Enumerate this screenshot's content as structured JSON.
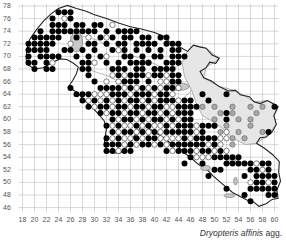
{
  "map": {
    "caption_species": "Dryopteris affinis",
    "caption_suffix": " agg.",
    "y_axis_ticks": [
      78,
      76,
      74,
      72,
      70,
      68,
      66,
      64,
      62,
      60,
      58,
      56,
      54,
      52,
      50,
      48,
      46
    ],
    "x_axis_ticks": [
      18,
      20,
      22,
      24,
      26,
      28,
      30,
      32,
      34,
      36,
      38,
      40,
      42,
      44,
      46,
      48,
      50,
      52,
      54,
      56,
      58,
      60
    ],
    "colors": {
      "grid": "#bdbdbd",
      "outline": "#222222",
      "inner_border": "#888888",
      "shaded_region": "#e6e6e6",
      "record_recent": "#000000",
      "record_old": "#ffffff",
      "record_gray": "#a8a8a8"
    },
    "legend_semantics": {
      "filled_black": "recent record",
      "open_white": "older record",
      "gray": "record in shaded zone"
    },
    "records_black": [
      [
        24,
        77
      ],
      [
        25,
        77
      ],
      [
        26,
        77
      ],
      [
        23,
        76
      ],
      [
        26,
        76
      ],
      [
        23,
        75
      ],
      [
        24,
        75
      ],
      [
        25,
        75
      ],
      [
        27,
        75
      ],
      [
        28,
        75
      ],
      [
        30,
        75
      ],
      [
        31,
        75
      ],
      [
        21,
        74
      ],
      [
        23,
        74
      ],
      [
        24,
        74
      ],
      [
        25,
        74
      ],
      [
        26,
        74
      ],
      [
        27,
        74
      ],
      [
        28,
        74
      ],
      [
        29,
        74
      ],
      [
        30,
        74
      ],
      [
        32,
        74
      ],
      [
        34,
        74
      ],
      [
        35,
        74
      ],
      [
        36,
        74
      ],
      [
        37,
        74
      ],
      [
        20,
        73
      ],
      [
        21,
        73
      ],
      [
        22,
        73
      ],
      [
        23,
        73
      ],
      [
        24,
        73
      ],
      [
        27,
        73
      ],
      [
        31,
        73
      ],
      [
        33,
        73
      ],
      [
        35,
        73
      ],
      [
        36,
        73
      ],
      [
        38,
        73
      ],
      [
        39,
        73
      ],
      [
        41,
        73
      ],
      [
        42,
        73
      ],
      [
        19,
        72
      ],
      [
        20,
        72
      ],
      [
        21,
        72
      ],
      [
        22,
        72
      ],
      [
        23,
        72
      ],
      [
        29,
        72
      ],
      [
        30,
        72
      ],
      [
        32,
        72
      ],
      [
        34,
        72
      ],
      [
        35,
        72
      ],
      [
        37,
        72
      ],
      [
        38,
        72
      ],
      [
        39,
        72
      ],
      [
        40,
        72
      ],
      [
        42,
        72
      ],
      [
        43,
        72
      ],
      [
        44,
        72
      ],
      [
        19,
        71
      ],
      [
        20,
        71
      ],
      [
        21,
        71
      ],
      [
        22,
        71
      ],
      [
        25,
        71
      ],
      [
        26,
        71
      ],
      [
        28,
        71
      ],
      [
        30,
        71
      ],
      [
        33,
        71
      ],
      [
        35,
        71
      ],
      [
        37,
        71
      ],
      [
        39,
        71
      ],
      [
        41,
        71
      ],
      [
        43,
        71
      ],
      [
        44,
        71
      ],
      [
        19,
        70
      ],
      [
        21,
        70
      ],
      [
        22,
        70
      ],
      [
        23,
        70
      ],
      [
        24,
        70
      ],
      [
        27,
        70
      ],
      [
        29,
        70
      ],
      [
        31,
        70
      ],
      [
        35,
        70
      ],
      [
        36,
        70
      ],
      [
        38,
        70
      ],
      [
        40,
        70
      ],
      [
        41,
        70
      ],
      [
        43,
        70
      ],
      [
        44,
        70
      ],
      [
        45,
        70
      ],
      [
        19,
        69
      ],
      [
        20,
        69
      ],
      [
        22,
        69
      ],
      [
        28,
        69
      ],
      [
        29,
        69
      ],
      [
        32,
        69
      ],
      [
        34,
        69
      ],
      [
        36,
        69
      ],
      [
        37,
        69
      ],
      [
        38,
        69
      ],
      [
        39,
        69
      ],
      [
        42,
        69
      ],
      [
        43,
        69
      ],
      [
        44,
        69
      ],
      [
        20,
        68
      ],
      [
        22,
        68
      ],
      [
        23,
        68
      ],
      [
        28,
        68
      ],
      [
        29,
        68
      ],
      [
        33,
        68
      ],
      [
        34,
        68
      ],
      [
        35,
        68
      ],
      [
        37,
        68
      ],
      [
        38,
        68
      ],
      [
        40,
        68
      ],
      [
        41,
        68
      ],
      [
        42,
        68
      ],
      [
        43,
        68
      ],
      [
        29,
        67
      ],
      [
        34,
        67
      ],
      [
        36,
        67
      ],
      [
        37,
        67
      ],
      [
        38,
        67
      ],
      [
        40,
        67
      ],
      [
        41,
        67
      ],
      [
        43,
        67
      ],
      [
        44,
        67
      ],
      [
        30,
        66
      ],
      [
        35,
        66
      ],
      [
        36,
        66
      ],
      [
        37,
        66
      ],
      [
        39,
        66
      ],
      [
        43,
        66
      ],
      [
        44,
        66
      ],
      [
        26,
        65
      ],
      [
        31,
        65
      ],
      [
        32,
        65
      ],
      [
        33,
        65
      ],
      [
        34,
        65
      ],
      [
        36,
        65
      ],
      [
        38,
        65
      ],
      [
        40,
        65
      ],
      [
        42,
        65
      ],
      [
        43,
        65
      ],
      [
        27,
        64
      ],
      [
        28,
        64
      ],
      [
        29,
        64
      ],
      [
        33,
        64
      ],
      [
        34,
        64
      ],
      [
        35,
        64
      ],
      [
        37,
        64
      ],
      [
        38,
        64
      ],
      [
        39,
        64
      ],
      [
        41,
        64
      ],
      [
        42,
        64
      ],
      [
        48,
        64
      ],
      [
        52,
        64
      ],
      [
        28,
        63
      ],
      [
        30,
        63
      ],
      [
        32,
        63
      ],
      [
        34,
        63
      ],
      [
        36,
        63
      ],
      [
        37,
        63
      ],
      [
        39,
        63
      ],
      [
        41,
        63
      ],
      [
        42,
        63
      ],
      [
        43,
        63
      ],
      [
        45,
        63
      ],
      [
        46,
        63
      ],
      [
        49,
        63
      ],
      [
        29,
        62
      ],
      [
        31,
        62
      ],
      [
        32,
        62
      ],
      [
        34,
        62
      ],
      [
        35,
        62
      ],
      [
        37,
        62
      ],
      [
        38,
        62
      ],
      [
        40,
        62
      ],
      [
        41,
        62
      ],
      [
        44,
        62
      ],
      [
        45,
        62
      ],
      [
        46,
        62
      ],
      [
        47,
        62
      ],
      [
        60,
        62
      ],
      [
        31,
        61
      ],
      [
        33,
        61
      ],
      [
        34,
        61
      ],
      [
        36,
        61
      ],
      [
        37,
        61
      ],
      [
        39,
        61
      ],
      [
        40,
        61
      ],
      [
        42,
        61
      ],
      [
        44,
        61
      ],
      [
        45,
        61
      ],
      [
        46,
        61
      ],
      [
        52,
        61
      ],
      [
        33,
        60
      ],
      [
        35,
        60
      ],
      [
        36,
        60
      ],
      [
        38,
        60
      ],
      [
        40,
        60
      ],
      [
        41,
        60
      ],
      [
        43,
        60
      ],
      [
        45,
        60
      ],
      [
        46,
        60
      ],
      [
        52,
        60
      ],
      [
        32,
        59
      ],
      [
        34,
        59
      ],
      [
        37,
        59
      ],
      [
        39,
        59
      ],
      [
        42,
        59
      ],
      [
        44,
        59
      ],
      [
        45,
        59
      ],
      [
        46,
        59
      ],
      [
        48,
        59
      ],
      [
        49,
        59
      ],
      [
        50,
        59
      ],
      [
        33,
        58
      ],
      [
        35,
        58
      ],
      [
        36,
        58
      ],
      [
        38,
        58
      ],
      [
        40,
        58
      ],
      [
        42,
        58
      ],
      [
        43,
        58
      ],
      [
        44,
        58
      ],
      [
        45,
        58
      ],
      [
        46,
        58
      ],
      [
        48,
        58
      ],
      [
        59,
        58
      ],
      [
        32,
        57
      ],
      [
        34,
        57
      ],
      [
        37,
        57
      ],
      [
        39,
        57
      ],
      [
        40,
        57
      ],
      [
        45,
        57
      ],
      [
        47,
        57
      ],
      [
        48,
        57
      ],
      [
        49,
        57
      ],
      [
        50,
        57
      ],
      [
        32,
        56
      ],
      [
        33,
        56
      ],
      [
        34,
        56
      ],
      [
        36,
        56
      ],
      [
        38,
        56
      ],
      [
        39,
        56
      ],
      [
        41,
        56
      ],
      [
        43,
        56
      ],
      [
        44,
        56
      ],
      [
        45,
        56
      ],
      [
        46,
        56
      ],
      [
        47,
        56
      ],
      [
        48,
        56
      ],
      [
        50,
        56
      ],
      [
        32,
        55
      ],
      [
        33,
        55
      ],
      [
        35,
        55
      ],
      [
        36,
        55
      ],
      [
        42,
        55
      ],
      [
        44,
        55
      ],
      [
        45,
        55
      ],
      [
        46,
        55
      ],
      [
        48,
        55
      ],
      [
        49,
        55
      ],
      [
        51,
        55
      ],
      [
        46,
        54
      ],
      [
        50,
        54
      ],
      [
        51,
        54
      ],
      [
        52,
        54
      ],
      [
        53,
        54
      ],
      [
        54,
        54
      ],
      [
        45,
        53
      ],
      [
        48,
        53
      ],
      [
        52,
        53
      ],
      [
        53,
        53
      ],
      [
        54,
        53
      ],
      [
        55,
        53
      ],
      [
        56,
        53
      ],
      [
        58,
        53
      ],
      [
        59,
        53
      ],
      [
        50,
        52
      ],
      [
        51,
        52
      ],
      [
        56,
        52
      ],
      [
        57,
        52
      ],
      [
        59,
        52
      ],
      [
        49,
        51
      ],
      [
        55,
        51
      ],
      [
        57,
        51
      ],
      [
        58,
        51
      ],
      [
        59,
        51
      ],
      [
        60,
        51
      ],
      [
        57,
        50
      ],
      [
        58,
        50
      ],
      [
        60,
        50
      ],
      [
        52,
        49
      ],
      [
        56,
        49
      ],
      [
        57,
        49
      ],
      [
        58,
        49
      ],
      [
        59,
        49
      ],
      [
        60,
        49
      ],
      [
        55,
        48
      ],
      [
        59,
        48
      ],
      [
        60,
        48
      ],
      [
        56,
        47
      ]
    ],
    "records_white": [
      [
        25,
        76
      ],
      [
        33,
        75
      ],
      [
        32,
        73
      ],
      [
        29,
        73
      ],
      [
        26,
        72
      ],
      [
        34,
        71
      ],
      [
        32,
        70
      ],
      [
        30,
        69
      ],
      [
        23,
        69
      ],
      [
        39,
        69
      ],
      [
        33,
        67
      ],
      [
        35,
        67
      ],
      [
        39,
        67
      ],
      [
        42,
        67
      ],
      [
        32,
        66
      ],
      [
        34,
        66
      ],
      [
        41,
        66
      ],
      [
        42,
        66
      ],
      [
        35,
        65
      ],
      [
        37,
        65
      ],
      [
        39,
        65
      ],
      [
        41,
        65
      ],
      [
        44,
        65
      ],
      [
        30,
        64
      ],
      [
        31,
        64
      ],
      [
        32,
        64
      ],
      [
        36,
        64
      ],
      [
        40,
        64
      ],
      [
        43,
        64
      ],
      [
        29,
        63
      ],
      [
        31,
        63
      ],
      [
        33,
        63
      ],
      [
        35,
        63
      ],
      [
        38,
        63
      ],
      [
        40,
        63
      ],
      [
        44,
        63
      ],
      [
        30,
        62
      ],
      [
        33,
        62
      ],
      [
        36,
        62
      ],
      [
        39,
        62
      ],
      [
        42,
        62
      ],
      [
        43,
        62
      ],
      [
        32,
        61
      ],
      [
        35,
        61
      ],
      [
        38,
        61
      ],
      [
        41,
        61
      ],
      [
        43,
        61
      ],
      [
        34,
        60
      ],
      [
        37,
        60
      ],
      [
        39,
        60
      ],
      [
        42,
        60
      ],
      [
        44,
        60
      ],
      [
        33,
        59
      ],
      [
        35,
        59
      ],
      [
        36,
        59
      ],
      [
        38,
        59
      ],
      [
        40,
        59
      ],
      [
        41,
        59
      ],
      [
        43,
        59
      ],
      [
        47,
        59
      ],
      [
        34,
        58
      ],
      [
        37,
        58
      ],
      [
        39,
        58
      ],
      [
        41,
        58
      ],
      [
        47,
        58
      ],
      [
        52,
        58
      ],
      [
        33,
        57
      ],
      [
        35,
        57
      ],
      [
        36,
        57
      ],
      [
        38,
        57
      ],
      [
        41,
        57
      ],
      [
        42,
        57
      ],
      [
        43,
        57
      ],
      [
        44,
        57
      ],
      [
        46,
        57
      ],
      [
        51,
        57
      ],
      [
        52,
        57
      ],
      [
        35,
        56
      ],
      [
        37,
        56
      ],
      [
        40,
        56
      ],
      [
        42,
        56
      ],
      [
        49,
        56
      ],
      [
        51,
        56
      ],
      [
        34,
        55
      ],
      [
        43,
        55
      ],
      [
        47,
        55
      ],
      [
        50,
        55
      ],
      [
        52,
        55
      ],
      [
        47,
        54
      ],
      [
        48,
        54
      ],
      [
        49,
        54
      ],
      [
        57,
        53
      ],
      [
        58,
        52
      ],
      [
        56,
        50
      ],
      [
        59,
        50
      ]
    ],
    "records_gray": [
      [
        48,
        62
      ],
      [
        50,
        62
      ],
      [
        53,
        62
      ],
      [
        56,
        62
      ],
      [
        58,
        62
      ],
      [
        51,
        61
      ],
      [
        53,
        61
      ],
      [
        57,
        61
      ],
      [
        50,
        60
      ],
      [
        54,
        60
      ],
      [
        56,
        60
      ],
      [
        50,
        59
      ],
      [
        52,
        59
      ],
      [
        56,
        59
      ],
      [
        51,
        58
      ],
      [
        54,
        58
      ],
      [
        58,
        58
      ],
      [
        53,
        57
      ],
      [
        55,
        57
      ],
      [
        50,
        56
      ],
      [
        53,
        56
      ]
    ],
    "inner_features": [
      {
        "type": "lake",
        "x": 27,
        "y": 72.3,
        "rx": 1.0,
        "ry": 1.6
      },
      {
        "type": "lake",
        "x": 44,
        "y": 65.2,
        "rx": 1.8,
        "ry": 0.6
      },
      {
        "type": "lake",
        "x": 53,
        "y": 53.4,
        "rx": 0.9,
        "ry": 0.4
      },
      {
        "type": "lake",
        "x": 48.5,
        "y": 52.3,
        "rx": 0.8,
        "ry": 0.4
      },
      {
        "type": "lake",
        "x": 53.5,
        "y": 50.2,
        "rx": 0.3,
        "ry": 0.6
      },
      {
        "type": "lake",
        "x": 52.5,
        "y": 47.9,
        "rx": 0.9,
        "ry": 0.3
      }
    ]
  }
}
